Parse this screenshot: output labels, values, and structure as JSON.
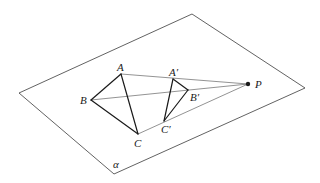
{
  "figure": {
    "plane_label": "α",
    "plane_corners": {
      "left": [
        19,
        93
      ],
      "top": [
        192,
        14
      ],
      "right": [
        305,
        88
      ],
      "bottom": [
        114,
        174
      ]
    },
    "center_point": {
      "label": "P",
      "pos": [
        248,
        84
      ]
    },
    "triangle_original": {
      "A": {
        "label": "A",
        "pos": [
          121,
          74
        ]
      },
      "B": {
        "label": "B",
        "pos": [
          91,
          100
        ]
      },
      "C": {
        "label": "C",
        "pos": [
          138,
          134
        ]
      }
    },
    "triangle_image": {
      "A": {
        "label": "A′",
        "pos": [
          173,
          79
        ]
      },
      "B": {
        "label": "B′",
        "pos": [
          188,
          90
        ]
      },
      "C": {
        "label": "C′",
        "pos": [
          164,
          121
        ]
      }
    },
    "colors": {
      "line": "#1a1a1a",
      "background": "#ffffff"
    }
  }
}
